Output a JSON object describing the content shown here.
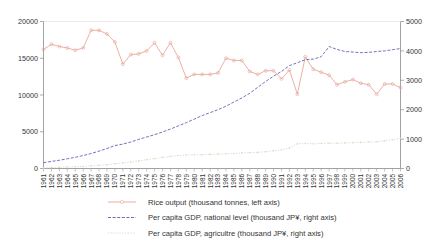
{
  "chart_data": {
    "type": "line",
    "title": "",
    "xlabel": "",
    "ylabel": "",
    "grid": false,
    "legend_position": "bottom",
    "x": [
      1961,
      1962,
      1963,
      1964,
      1965,
      1966,
      1967,
      1968,
      1969,
      1970,
      1971,
      1972,
      1973,
      1974,
      1975,
      1976,
      1977,
      1978,
      1979,
      1980,
      1981,
      1982,
      1983,
      1984,
      1985,
      1986,
      1987,
      1988,
      1989,
      1990,
      1991,
      1992,
      1993,
      1994,
      1995,
      1996,
      1997,
      1998,
      1999,
      2000,
      2001,
      2002,
      2003,
      2004,
      2005,
      2006
    ],
    "categories": [
      "1961",
      "1962",
      "1963",
      "1964",
      "1965",
      "1966",
      "1967",
      "1968",
      "1969",
      "1970",
      "1971",
      "1972",
      "1973",
      "1974",
      "1975",
      "1976",
      "1977",
      "1978",
      "1979",
      "1980",
      "1981",
      "1982",
      "1983",
      "1984",
      "1985",
      "1986",
      "1987",
      "1988",
      "1989",
      "1990",
      "1991",
      "1992",
      "1993",
      "1994",
      "1995",
      "1996",
      "1997",
      "1998",
      "1999",
      "2000",
      "2001",
      "2002",
      "2003",
      "2004",
      "2005",
      "2006"
    ],
    "axes": {
      "left": {
        "label": "Rice output (thousand tonnes)",
        "ylim": [
          0,
          20000
        ],
        "ticks": [
          0,
          5000,
          10000,
          15000,
          20000
        ],
        "tick_labels": [
          "0",
          "5000",
          "10000",
          "15000",
          "20000"
        ]
      },
      "right": {
        "label": "Per capita GDP (thousand JP¥)",
        "ylim": [
          0,
          5000
        ],
        "ticks": [
          0,
          1000,
          2000,
          3000,
          4000,
          5000
        ],
        "tick_labels": [
          "0",
          "1000",
          "2000",
          "3000",
          "4000",
          "5000"
        ]
      },
      "x": {
        "range": [
          1961,
          2006
        ]
      }
    },
    "series": [
      {
        "name": "Rice output (thousand tonnes, left axis)",
        "axis": "left",
        "color": "#e8a296",
        "marker": "circle",
        "values": [
          16200,
          16900,
          16600,
          16400,
          16100,
          16400,
          18800,
          18800,
          18300,
          17200,
          14200,
          15500,
          15600,
          16000,
          17100,
          15400,
          17100,
          15100,
          12300,
          12800,
          12800,
          12800,
          13000,
          15000,
          14700,
          14700,
          13200,
          12800,
          13300,
          13300,
          12200,
          13400,
          10100,
          15200,
          13500,
          13100,
          12700,
          11400,
          11800,
          12100,
          11600,
          11400,
          10100,
          11500,
          11500,
          11000
        ]
      },
      {
        "name": "Per capita GDP, national level (thousand JP¥, right axis)",
        "axis": "right",
        "color": "#5a5ab0",
        "marker": "dash",
        "values": [
          200,
          240,
          280,
          330,
          380,
          440,
          510,
          590,
          680,
          780,
          830,
          900,
          990,
          1070,
          1150,
          1240,
          1340,
          1450,
          1560,
          1680,
          1800,
          1900,
          2000,
          2120,
          2260,
          2400,
          2560,
          2760,
          2960,
          3140,
          3300,
          3500,
          3600,
          3700,
          3720,
          3800,
          4150,
          4050,
          3980,
          3960,
          3940,
          3950,
          3980,
          4000,
          4040,
          4080
        ]
      },
      {
        "name": "Per capita GDP, agricultre (thousand JP¥, right axis)",
        "axis": "right",
        "color": "#cfe0c4",
        "marker": "dot",
        "values": [
          20,
          30,
          40,
          50,
          60,
          70,
          90,
          110,
          130,
          160,
          190,
          220,
          260,
          300,
          340,
          380,
          410,
          440,
          460,
          470,
          470,
          480,
          490,
          500,
          510,
          530,
          540,
          550,
          570,
          600,
          640,
          700,
          840,
          850,
          840,
          850,
          860,
          860,
          870,
          880,
          890,
          900,
          910,
          940,
          980,
          1030
        ]
      }
    ],
    "legend": [
      {
        "label": "Rice output (thousand tonnes, left axis)",
        "color": "#e8a296",
        "style": "line-marker"
      },
      {
        "label": "Per capita GDP, national level (thousand JP¥, right axis)",
        "color": "#5a5ab0",
        "style": "dashed"
      },
      {
        "label": "Per capita GDP, agricultre (thousand JP¥, right axis)",
        "color": "#cfe0c4",
        "style": "dotted"
      }
    ]
  }
}
